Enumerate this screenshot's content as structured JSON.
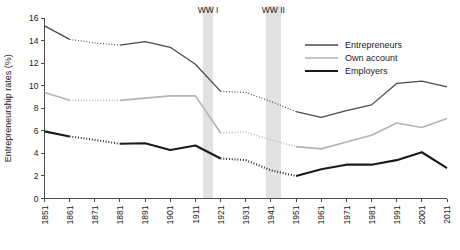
{
  "chart_data": {
    "type": "line",
    "title": "",
    "xlabel": "",
    "ylabel": "Entrepreneurship rates (%)",
    "xlim": [
      1851,
      2011
    ],
    "ylim": [
      0,
      16
    ],
    "grid": false,
    "legend_position": "top-right",
    "x": [
      1851,
      1861,
      1871,
      1881,
      1891,
      1901,
      1911,
      1921,
      1931,
      1941,
      1951,
      1961,
      1971,
      1981,
      1991,
      2001,
      2011
    ],
    "xtick_labels": [
      "1851",
      "1861",
      "1871",
      "1881",
      "1891",
      "1901",
      "1911",
      "1921",
      "1931",
      "1941",
      "1951",
      "1961",
      "1971",
      "1981",
      "1991",
      "2001",
      "2011"
    ],
    "ytick_labels": [
      "0",
      "2",
      "4",
      "6",
      "8",
      "10",
      "12",
      "14",
      "16"
    ],
    "ytick_values": [
      0,
      2,
      4,
      6,
      8,
      10,
      12,
      14,
      16
    ],
    "series": [
      {
        "name": "Entrepreneurs",
        "color": "#4a4a4a",
        "width": 1.3,
        "values": [
          15.3,
          14.1,
          13.8,
          13.6,
          13.9,
          13.4,
          11.9,
          9.5,
          9.4,
          8.6,
          7.7,
          7.2,
          7.8,
          8.3,
          10.2,
          10.4,
          9.9
        ],
        "dotted_segments": [
          [
            1861,
            1881
          ],
          [
            1921,
            1951
          ]
        ]
      },
      {
        "name": "Own account",
        "color": "#b3b3b3",
        "width": 1.6,
        "values": [
          9.4,
          8.7,
          8.7,
          8.7,
          8.9,
          9.1,
          9.1,
          5.8,
          5.9,
          5.2,
          4.6,
          4.4,
          5.0,
          5.6,
          6.7,
          6.3,
          7.1
        ],
        "dotted_segments": [
          [
            1861,
            1881
          ],
          [
            1921,
            1951
          ]
        ]
      },
      {
        "name": "Employers",
        "color": "#1a1a1a",
        "width": 2.1,
        "values": [
          5.95,
          5.5,
          5.2,
          4.85,
          4.9,
          4.3,
          4.7,
          3.55,
          3.4,
          2.5,
          2.0,
          2.6,
          3.0,
          3.0,
          3.4,
          4.1,
          2.7
        ],
        "dotted_segments": [
          [
            1861,
            1881
          ],
          [
            1921,
            1951
          ]
        ]
      }
    ],
    "annotations": [
      {
        "label": "WW I",
        "start": 1914,
        "end": 1918,
        "color": "#e2e2e2"
      },
      {
        "label": "WW II",
        "start": 1939,
        "end": 1945,
        "color": "#e2e2e2"
      }
    ]
  }
}
